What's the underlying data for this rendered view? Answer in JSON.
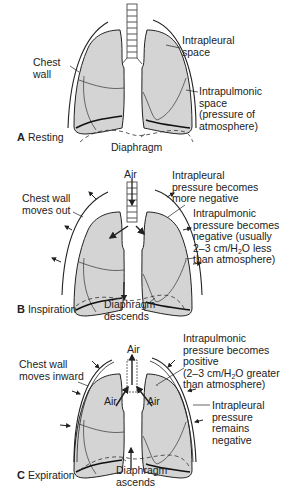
{
  "figure": {
    "colors": {
      "lung_fill": "#d4d4d4",
      "outline": "#222222",
      "background": "#ffffff"
    },
    "panels": [
      {
        "id": "A",
        "letter": "A",
        "title": "Resting",
        "labels": {
          "chest_wall": [
            "Chest",
            "wall"
          ],
          "intrapleural": [
            "Intrapleural",
            "space"
          ],
          "intrapulmonic": [
            "Intrapulmonic",
            "space",
            "(pressure of",
            "atmosphere)"
          ],
          "diaphragm": [
            "Diaphragm"
          ]
        }
      },
      {
        "id": "B",
        "letter": "B",
        "title": "Inspiration",
        "labels": {
          "air": "Air",
          "chest_wall": [
            "Chest wall",
            "moves out"
          ],
          "intrapleural": [
            "Intrapleural",
            "pressure becomes",
            "more negative"
          ],
          "intrapulmonic": [
            "Intrapulmonic",
            "pressure becomes",
            "negative (usually"
          ],
          "intrapulmonic_line4_pre": "2–3 cm/H",
          "intrapulmonic_line4_sub": "2",
          "intrapulmonic_line4_post": "O less",
          "intrapulmonic_line5": "than atmosphere)",
          "diaphragm": [
            "Diaphragm",
            "descends"
          ]
        }
      },
      {
        "id": "C",
        "letter": "C",
        "title": "Expiration",
        "labels": {
          "air_top": "Air",
          "air_left": "Air",
          "air_right": "Air",
          "chest_wall": [
            "Chest wall",
            "moves inward"
          ],
          "intrapulmonic": [
            "Intrapulmonic",
            "pressure becomes",
            "positive"
          ],
          "intrapulmonic_line4_pre": "(2–3 cm/H",
          "intrapulmonic_line4_sub": "2",
          "intrapulmonic_line4_post": "O greater",
          "intrapulmonic_line5": "than atmosphere)",
          "intrapleural": [
            "Intrapleural",
            "pressure",
            "remains",
            "negative"
          ],
          "diaphragm": [
            "Diaphragm",
            "ascends"
          ]
        }
      }
    ]
  }
}
